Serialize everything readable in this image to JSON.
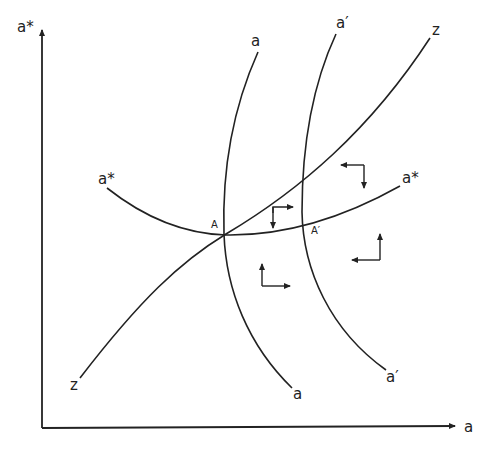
{
  "axes": {
    "x_label": "a",
    "y_label": "a*"
  },
  "curves": {
    "a": {
      "top_label": "a",
      "bottom_label": "a"
    },
    "a_prime": {
      "top_label": "a′",
      "bottom_label": "a′"
    },
    "z": {
      "top_label": "z",
      "bottom_label": "z"
    },
    "a_star": {
      "left_label": "a*",
      "right_label": "a*"
    }
  },
  "points": {
    "A": "A",
    "A_prime": "A′"
  },
  "arrows": [
    {
      "region": "between z and a* near A",
      "directions": [
        "right",
        "down"
      ]
    },
    {
      "region": "upper right",
      "directions": [
        "left",
        "down"
      ]
    },
    {
      "region": "lower middle",
      "directions": [
        "up",
        "right"
      ]
    },
    {
      "region": "lower right",
      "directions": [
        "up",
        "left"
      ]
    }
  ]
}
